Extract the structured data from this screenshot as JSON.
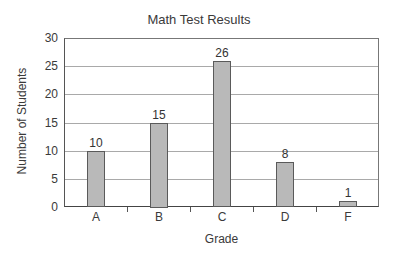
{
  "chart_data": {
    "type": "bar",
    "title": "Math Test Results",
    "xlabel": "Grade",
    "ylabel": "Number of Students",
    "categories": [
      "A",
      "B",
      "C",
      "D",
      "F"
    ],
    "values": [
      10,
      15,
      26,
      8,
      1
    ],
    "data_labels": [
      "10",
      "15",
      "26",
      "8",
      "1"
    ],
    "ylim": [
      0,
      30
    ],
    "yticks": [
      0,
      5,
      10,
      15,
      20,
      25,
      30
    ],
    "ytick_labels": [
      "0",
      "5",
      "10",
      "15",
      "20",
      "25",
      "30"
    ],
    "grid": true,
    "legend": null,
    "colors": {
      "bar_fill": "#b9b9b9",
      "bar_border": "#5a5a5a",
      "grid": "#a9a9a9",
      "text": "#3a3a3a"
    }
  }
}
